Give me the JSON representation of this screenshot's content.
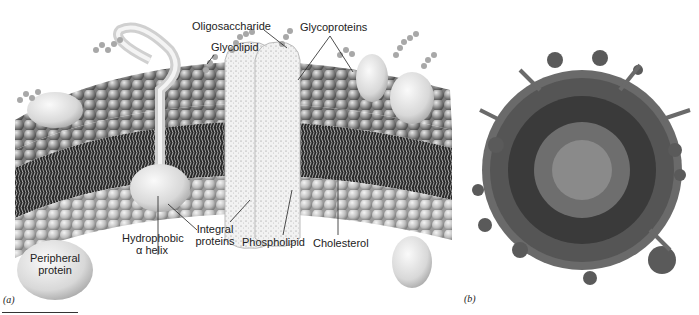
{
  "figure": {
    "panel_a": {
      "tag": "(a)",
      "title": "Plasma membrane schematic (fluid mosaic model)",
      "labels": {
        "oligosaccharide": "Oligosaccharide",
        "glycoproteins": "Glycoproteins",
        "glycolipid": "Glycolipid",
        "peripheral_protein_1": "Peripheral",
        "peripheral_protein_2": "protein",
        "hydrophobic_helix_1": "Hydrophobic",
        "hydrophobic_helix_2": "α helix",
        "integral_proteins_1": "Integral",
        "integral_proteins_2": "proteins",
        "phospholipid": "Phospholipid",
        "cholesterol": "Cholesterol"
      }
    },
    "panel_b": {
      "tag": "(b)",
      "title": "Molecular model of membrane vesicle"
    },
    "colors": {
      "head_dark": "#6e6e6e",
      "head_light": "#c8c8c8",
      "tail": "#9a9a9a",
      "core": "#1a1a1a",
      "protein": "#e4e4e4",
      "text": "#222222"
    }
  }
}
